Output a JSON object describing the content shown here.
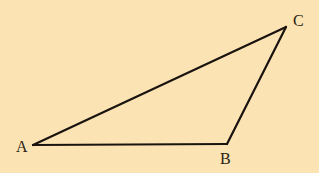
{
  "diagram": {
    "type": "triangle",
    "background": "#fbe3b3",
    "stroke_color": "#1a1410",
    "vertices": [
      {
        "name": "A",
        "label": "A",
        "x": 33,
        "y": 145
      },
      {
        "name": "B",
        "label": "B",
        "x": 227,
        "y": 144
      },
      {
        "name": "C",
        "label": "C",
        "x": 286,
        "y": 27
      }
    ],
    "edges": [
      {
        "from": "A",
        "to": "B"
      },
      {
        "from": "B",
        "to": "C"
      },
      {
        "from": "C",
        "to": "A"
      }
    ]
  },
  "labels": {
    "a": "A",
    "b": "B",
    "c": "C"
  }
}
